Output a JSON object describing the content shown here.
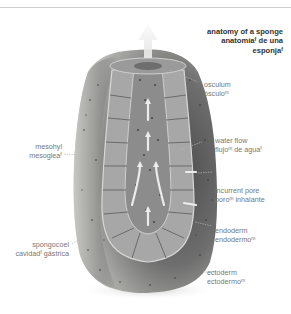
{
  "title": {
    "line1": "anatomy of a sponge",
    "line2": "anatomíaᶠ de una",
    "line3": "esponjaᶠ"
  },
  "labels": {
    "osculum": {
      "en": "osculum",
      "es": "ósculoᵐ"
    },
    "water_flow": {
      "en": "water flow",
      "es": "flujoᵐ de aguaᶠ"
    },
    "incurrent_pore": {
      "en": "incurrent pore",
      "es": "poroᵐ inhalante"
    },
    "endoderm": {
      "en": "endoderm",
      "es": "endodermoᵐ"
    },
    "ectoderm": {
      "en": "ectoderm",
      "es": "ectodermoᵐ"
    },
    "mesohyl": {
      "en": "mesohyl",
      "es": "mesogleaᶠ"
    },
    "spongocoel": {
      "en": "spongocoel",
      "es": "cavidadᶠ gástrica"
    }
  },
  "colors": {
    "outer_body": "#7a7a7a",
    "outer_light": "#b9b9b6",
    "endoderm_band": "#a9a9a9",
    "cavity": "#8e8e8e",
    "arrow": "#e8e8e8",
    "leader_line": "#b0b0b0",
    "title_text": "#333333",
    "label_text": "#777777"
  }
}
